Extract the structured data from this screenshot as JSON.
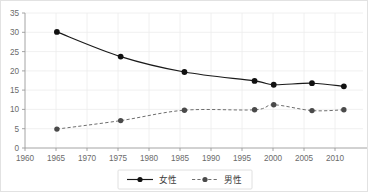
{
  "chart_data": {
    "type": "line",
    "title": "",
    "xlabel": "",
    "ylabel": "",
    "xlim": [
      1960,
      2013
    ],
    "ylim": [
      0,
      35
    ],
    "grid": true,
    "legend_position": "bottom-center",
    "x_ticks": [
      1960,
      1965,
      1970,
      1975,
      1980,
      1985,
      1990,
      1995,
      2000,
      2005,
      2010
    ],
    "x_tick_labels": [
      "1960",
      "1965",
      "1970",
      "1975",
      "1980",
      "1985",
      "1990",
      "1995",
      "2000",
      "2005",
      "2010"
    ],
    "y_ticks": [
      0,
      5,
      10,
      15,
      20,
      25,
      30,
      35
    ],
    "y_tick_labels": [
      "0",
      "5",
      "10",
      "15",
      "20",
      "25",
      "30",
      "35"
    ],
    "series": [
      {
        "name": "女性",
        "style": "solid",
        "color": "#1a1a1a",
        "marker": "circle",
        "x": [
          1965,
          1975,
          1985,
          1996,
          1999,
          2005,
          2010
        ],
        "values": [
          30.1,
          23.7,
          19.7,
          17.4,
          16.4,
          16.8,
          16.0
        ]
      },
      {
        "name": "男性",
        "style": "dashed",
        "color": "#6e6e6e",
        "marker": "circle",
        "x": [
          1965,
          1975,
          1985,
          1996,
          1999,
          2005,
          2010
        ],
        "values": [
          4.9,
          7.1,
          9.8,
          9.9,
          11.2,
          9.7,
          9.9
        ]
      }
    ]
  },
  "legend": {
    "female_label": "女性",
    "male_label": "男性"
  },
  "axes": {
    "y_label_35": "35",
    "y_label_30": "30",
    "y_label_25": "25",
    "y_label_20": "20",
    "y_label_15": "15",
    "y_label_10": "10",
    "y_label_5": "5",
    "y_label_0": "0",
    "x_label_1960": "1960",
    "x_label_1965": "1965",
    "x_label_1970": "1970",
    "x_label_1975": "1975",
    "x_label_1980": "1980",
    "x_label_1985": "1985",
    "x_label_1990": "1990",
    "x_label_1995": "1995",
    "x_label_2000": "2000",
    "x_label_2005": "2005",
    "x_label_2010": "2010"
  },
  "colors": {
    "female": "#1a1a1a",
    "male": "#6e6e6e",
    "grid": "#ececec",
    "axis": "#9a9a9a",
    "border": "#e2e2e2"
  }
}
